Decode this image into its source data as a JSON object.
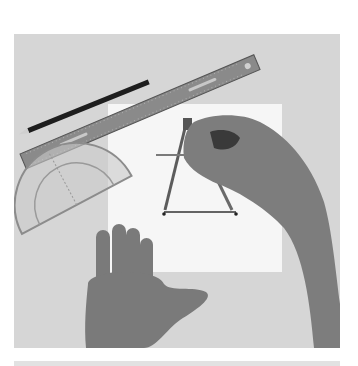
{
  "image": {
    "alt": "Hands using a drawing compass on white paper, with a metal ruler, black pencil and clear protractor on a gray table",
    "colors": {
      "table": "#d6d6d6",
      "paper": "#f6f6f6",
      "ruler": "#8a8a8a",
      "pencil": "#1e1e1e",
      "protractor": "#bfbfbf",
      "skin": "#7d7d7d",
      "skin_dark": "#5a5a5a",
      "line": "#333333",
      "strip": "#e2e2e2"
    }
  },
  "objects": [
    {
      "name": "metal-ruler"
    },
    {
      "name": "pencil"
    },
    {
      "name": "protractor"
    },
    {
      "name": "paper-sheet"
    },
    {
      "name": "drawing-compass"
    },
    {
      "name": "left-hand"
    },
    {
      "name": "right-hand"
    },
    {
      "name": "drawn-line-segment"
    }
  ]
}
